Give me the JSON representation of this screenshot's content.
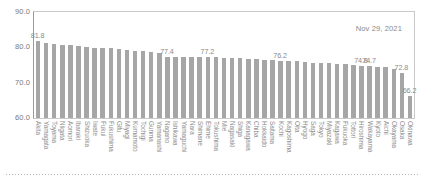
{
  "chart_data": {
    "type": "bar",
    "title": "",
    "subtitle": "",
    "xlabel": "",
    "ylabel": "",
    "ylim": [
      60.0,
      90.0
    ],
    "yticks": [
      "90.0",
      "80.0",
      "70.0",
      "60.0"
    ],
    "ytick_values": [
      90.0,
      80.0,
      70.0,
      60.0
    ],
    "grid": false,
    "legend": null,
    "annotations": [
      {
        "text": "Nov 29, 2021",
        "position": "top-right"
      }
    ],
    "bar_color": "#a6a6a6",
    "categories": [
      "Akita",
      "Yamagata",
      "Toyama",
      "Niigata",
      "Aomori",
      "Ibaraki",
      "Shizuoka",
      "Iwate",
      "Fukui",
      "Fukushima",
      "Gifu",
      "Miyagi",
      "Kumamoto",
      "Tochigi",
      "Gunma",
      "Yamanashi",
      "Nagano",
      "Ishikawa",
      "Yamaguchi",
      "Nara",
      "Shimane",
      "Ehime",
      "Tokushima",
      "Mie",
      "Nagasaki",
      "Shiga",
      "Kanagawa",
      "Chiba",
      "Hokkaido",
      "Saitama",
      "Kochi",
      "Kagoshima",
      "Oita",
      "Hyogo",
      "Saga",
      "Tokyo",
      "Miyazaki",
      "Kagawa",
      "Fukuoka",
      "Tottori",
      "Hiroshima",
      "Wakayama",
      "Kyoto",
      "Aichi",
      "Okayama",
      "Osaka",
      "Okinawa"
    ],
    "values": [
      81.8,
      81.2,
      80.9,
      80.8,
      80.6,
      80.3,
      80.0,
      79.9,
      79.8,
      79.7,
      79.5,
      79.3,
      79.1,
      78.9,
      78.6,
      78.4,
      77.4,
      77.3,
      77.3,
      77.2,
      77.2,
      77.2,
      77.2,
      77.1,
      77.0,
      76.9,
      76.8,
      76.7,
      76.5,
      76.4,
      76.2,
      76.1,
      76.0,
      75.9,
      75.7,
      75.6,
      75.5,
      75.3,
      75.2,
      75.0,
      74.8,
      74.7,
      74.5,
      74.3,
      74.0,
      72.8,
      66.2
    ],
    "point_labels": [
      {
        "index": 0,
        "text": "81.8"
      },
      {
        "index": 16,
        "text": "77.4"
      },
      {
        "index": 21,
        "text": "77.2"
      },
      {
        "index": 30,
        "text": "76.2"
      },
      {
        "index": 40,
        "text": "74.8"
      },
      {
        "index": 41,
        "text": "74.7"
      },
      {
        "index": 45,
        "text": "72.8"
      },
      {
        "index": 46,
        "text": "66.2"
      }
    ]
  }
}
